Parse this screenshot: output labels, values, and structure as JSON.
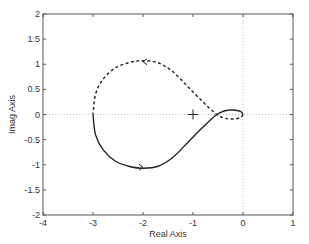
{
  "chart_data": {
    "type": "line",
    "title": "",
    "xlabel": "Real Axis",
    "ylabel": "Imag Axis",
    "xlim": [
      -4,
      1
    ],
    "ylim": [
      -2,
      2
    ],
    "xticks": [
      -4,
      -3,
      -2,
      -1,
      0,
      1
    ],
    "yticks": [
      -2,
      -1.5,
      -1,
      -0.5,
      0,
      0.5,
      1,
      1.5,
      2
    ],
    "xtick_labels": [
      "-4",
      "-3",
      "-2",
      "-1",
      "0",
      "1"
    ],
    "ytick_labels": [
      "-2",
      "-1.5",
      "-1",
      "-0.5",
      "0",
      "0.5",
      "1",
      "1.5",
      "2"
    ],
    "grid": false,
    "reference_lines": [
      {
        "orientation": "horizontal",
        "value": 0,
        "style": "dotted"
      },
      {
        "orientation": "vertical",
        "value": 0,
        "style": "dotted"
      }
    ],
    "markers": [
      {
        "label": "critical point",
        "x": -1,
        "y": 0,
        "symbol": "+"
      }
    ],
    "series": [
      {
        "name": "positive frequencies (Nyquist)",
        "style": "solid",
        "direction_arrow": {
          "x": -2,
          "y": -1.05,
          "points": "right"
        },
        "points": [
          [
            -3.0,
            0.0
          ],
          [
            -2.95,
            -0.4
          ],
          [
            -2.8,
            -0.7
          ],
          [
            -2.55,
            -0.93
          ],
          [
            -2.25,
            -1.04
          ],
          [
            -2.0,
            -1.07
          ],
          [
            -1.7,
            -1.03
          ],
          [
            -1.4,
            -0.85
          ],
          [
            -1.1,
            -0.55
          ],
          [
            -0.8,
            -0.25
          ],
          [
            -0.55,
            -0.02
          ],
          [
            -0.38,
            0.07
          ],
          [
            -0.2,
            0.09
          ],
          [
            -0.05,
            0.06
          ],
          [
            0.0,
            0.0
          ]
        ]
      },
      {
        "name": "negative frequencies (mirror)",
        "style": "dashed",
        "direction_arrow": {
          "x": -2,
          "y": 1.05,
          "points": "left"
        },
        "points": [
          [
            0.0,
            0.0
          ],
          [
            -0.05,
            -0.06
          ],
          [
            -0.2,
            -0.09
          ],
          [
            -0.38,
            -0.07
          ],
          [
            -0.55,
            0.02
          ],
          [
            -0.8,
            0.25
          ],
          [
            -1.1,
            0.55
          ],
          [
            -1.4,
            0.85
          ],
          [
            -1.7,
            1.03
          ],
          [
            -2.0,
            1.07
          ],
          [
            -2.25,
            1.04
          ],
          [
            -2.55,
            0.93
          ],
          [
            -2.8,
            0.7
          ],
          [
            -2.95,
            0.4
          ],
          [
            -3.0,
            0.0
          ]
        ]
      }
    ]
  }
}
